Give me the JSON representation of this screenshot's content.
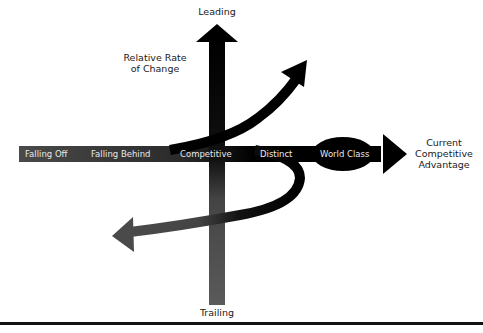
{
  "diagram": {
    "type": "competitive-position-axes",
    "vertical_axis": {
      "top_label": "Leading",
      "bottom_label": "Trailing",
      "name_line1": "Relative Rate",
      "name_line2": "of Change"
    },
    "horizontal_axis": {
      "name_line1": "Current",
      "name_line2": "Competitive",
      "name_line3": "Advantage",
      "stages": [
        "Falling Off",
        "Falling Behind",
        "Competitive",
        "Distinct",
        "World Class"
      ]
    },
    "colors": {
      "dark": "#000000",
      "mid": "#3a3a3a",
      "light": "#6a6a6a",
      "text_on_band": "#e8e8e8",
      "label_text": "#1a1a1a"
    }
  }
}
